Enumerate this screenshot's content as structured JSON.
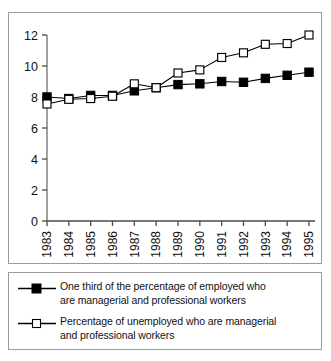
{
  "chart_data": {
    "type": "line",
    "title": "",
    "xlabel": "",
    "ylabel": "",
    "categories": [
      "1983",
      "1984",
      "1985",
      "1986",
      "1987",
      "1988",
      "1989",
      "1990",
      "1991",
      "1992",
      "1993",
      "1994",
      "1995"
    ],
    "x": [
      1983,
      1984,
      1985,
      1986,
      1987,
      1988,
      1989,
      1990,
      1991,
      1992,
      1993,
      1994,
      1995
    ],
    "ylim": [
      0,
      12
    ],
    "yticks": [
      0,
      2,
      4,
      6,
      8,
      10,
      12
    ],
    "ytick_labels": [
      "0",
      "2",
      "4",
      "6",
      "8",
      "10",
      "12"
    ],
    "grid": false,
    "legend_position": "bottom",
    "series": [
      {
        "name": "One third of the percentage of employed who are managerial and professional workers",
        "marker": "filled-square",
        "color": "#000000",
        "values": [
          8.0,
          7.9,
          8.1,
          8.1,
          8.4,
          8.6,
          8.8,
          8.85,
          9.0,
          8.95,
          9.2,
          9.4,
          9.6
        ]
      },
      {
        "name": "Percentage of unemployed who are managerial and professional workers",
        "marker": "open-square",
        "color": "#000000",
        "values": [
          7.55,
          7.85,
          7.9,
          8.05,
          8.85,
          8.6,
          9.55,
          9.75,
          10.55,
          10.85,
          11.4,
          11.45,
          12.0
        ]
      }
    ]
  },
  "legend": {
    "items": [
      {
        "marker": "filled-square",
        "line1": "One third of the percentage of employed who",
        "line2": "are managerial and professional workers"
      },
      {
        "marker": "open-square",
        "line1": "Percentage of unemployed who are managerial",
        "line2": "and professional workers"
      }
    ]
  },
  "axes": {
    "y_axis_label": "",
    "x_axis_label": ""
  }
}
